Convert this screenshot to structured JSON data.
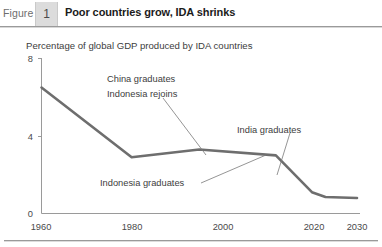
{
  "header": {
    "figure_label": "Figure",
    "figure_number": "1",
    "title": "Poor countries grow, IDA shrinks"
  },
  "subtitle": "Percentage of global GDP produced by IDA countries",
  "chart_data": {
    "type": "line",
    "title": "Poor countries grow, IDA shrinks",
    "subtitle": "Percentage of global GDP produced by IDA countries",
    "xlabel": "",
    "ylabel": "",
    "xlim": [
      1960,
      2030
    ],
    "ylim": [
      0,
      8
    ],
    "yticks": [
      "0",
      "4",
      "8"
    ],
    "ytick_values": [
      0,
      4,
      8
    ],
    "xticks": [
      "1960",
      "1980",
      "2000",
      "2020",
      "2030"
    ],
    "xtick_values": [
      1960,
      1980,
      2000,
      2020,
      2030
    ],
    "grid": false,
    "legend": "none",
    "series": [
      {
        "name": "Percentage of global GDP produced by IDA countries",
        "color": "#6e6e6e",
        "x": [
          1960,
          1980,
          1995,
          2012,
          2020,
          2023,
          2030
        ],
        "values": [
          6.5,
          2.9,
          3.3,
          3.0,
          1.1,
          0.85,
          0.8
        ]
      }
    ],
    "annotations": [
      {
        "text": "China graduates",
        "x": 1995,
        "y": 7.0
      },
      {
        "text": "Indonesia rejoins",
        "x": 1995,
        "y": 6.3
      },
      {
        "text": "India graduates",
        "x": 2017,
        "y": 4.2
      },
      {
        "text": "Indonesia graduates",
        "x": 1987,
        "y": 1.9
      }
    ]
  },
  "axis": {
    "y_top": "8",
    "y_mid": "4",
    "y_zero": "0",
    "x1": "1960",
    "x2": "1980",
    "x3": "2000",
    "x4": "2020",
    "x5": "2030"
  },
  "annotations": {
    "china": "China graduates",
    "indonesia_rejoins": "Indonesia rejoins",
    "india": "India graduates",
    "indonesia_graduates": "Indonesia graduates"
  },
  "colors": {
    "line": "#6e6e6e",
    "axis": "#9a9a9a",
    "text": "#3d3d3d",
    "figure_box": "#dcdcdc"
  }
}
